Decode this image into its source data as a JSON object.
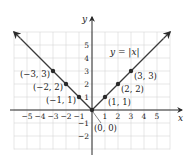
{
  "chart_data": {
    "type": "line",
    "title": "",
    "function_label": "y = |x|",
    "xlabel": "x",
    "ylabel": "y",
    "xlim": [
      -6,
      6
    ],
    "ylim": [
      -3,
      6
    ],
    "grid": true,
    "x_ticks": [
      "-5",
      "-4",
      "-3",
      "-2",
      "-1",
      "1",
      "2",
      "3",
      "4",
      "5"
    ],
    "y_ticks": [
      "5",
      "4",
      "3",
      "2",
      "1",
      "-1",
      "-2"
    ],
    "series": [
      {
        "name": "y = |x|",
        "x": [
          -6,
          0,
          6
        ],
        "y": [
          6,
          0,
          6
        ]
      }
    ],
    "points": [
      {
        "x": -3,
        "y": 3,
        "label": "(-3, 3)"
      },
      {
        "x": -2,
        "y": 2,
        "label": "(-2, 2)"
      },
      {
        "x": -1,
        "y": 1,
        "label": "(-1, 1)"
      },
      {
        "x": 0,
        "y": 0,
        "label": "(0, 0)"
      },
      {
        "x": 1,
        "y": 1,
        "label": "(1, 1)"
      },
      {
        "x": 2,
        "y": 2,
        "label": "(2, 2)"
      },
      {
        "x": 3,
        "y": 3,
        "label": "(3, 3)"
      }
    ],
    "colors": {
      "line": "#3a3a3a",
      "grid": "#d6d6d6",
      "axis": "#2a2a2a"
    }
  }
}
